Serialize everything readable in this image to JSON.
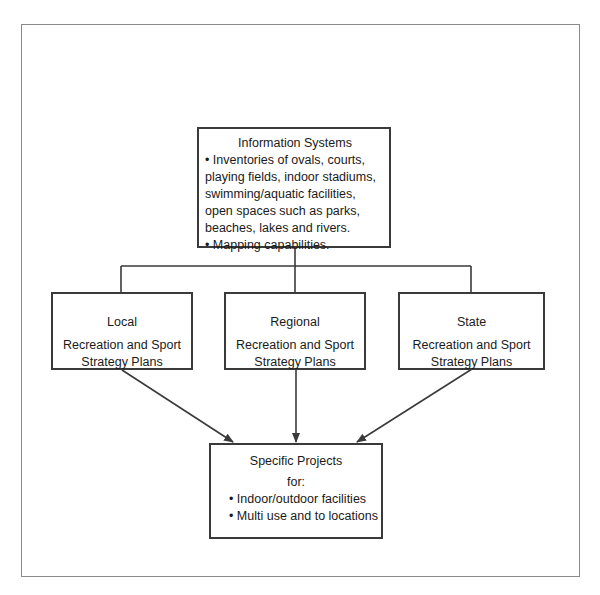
{
  "diagram": {
    "top": {
      "title": "Information Systems",
      "bullets": [
        "• Inventories of ovals, courts, playing fields, indoor stadiums, swimming/aquatic facilities, open spaces such as parks, beaches, lakes and rivers.",
        "• Mapping capabilities."
      ]
    },
    "plans": [
      {
        "level": "Local",
        "line1": "Recreation and Sport",
        "line2": "Strategy Plans"
      },
      {
        "level": "Regional",
        "line1": "Recreation and Sport",
        "line2": "Strategy Plans"
      },
      {
        "level": "State",
        "line1": "Recreation and Sport",
        "line2": "Strategy Plans"
      }
    ],
    "bottom": {
      "title": "Specific Projects",
      "for": "for:",
      "bullets": [
        "• Indoor/outdoor facilities",
        "• Multi use and to locations"
      ]
    },
    "colors": {
      "line": "#3a3a3a",
      "frame": "#8a8a8a",
      "background": "#ffffff"
    }
  }
}
